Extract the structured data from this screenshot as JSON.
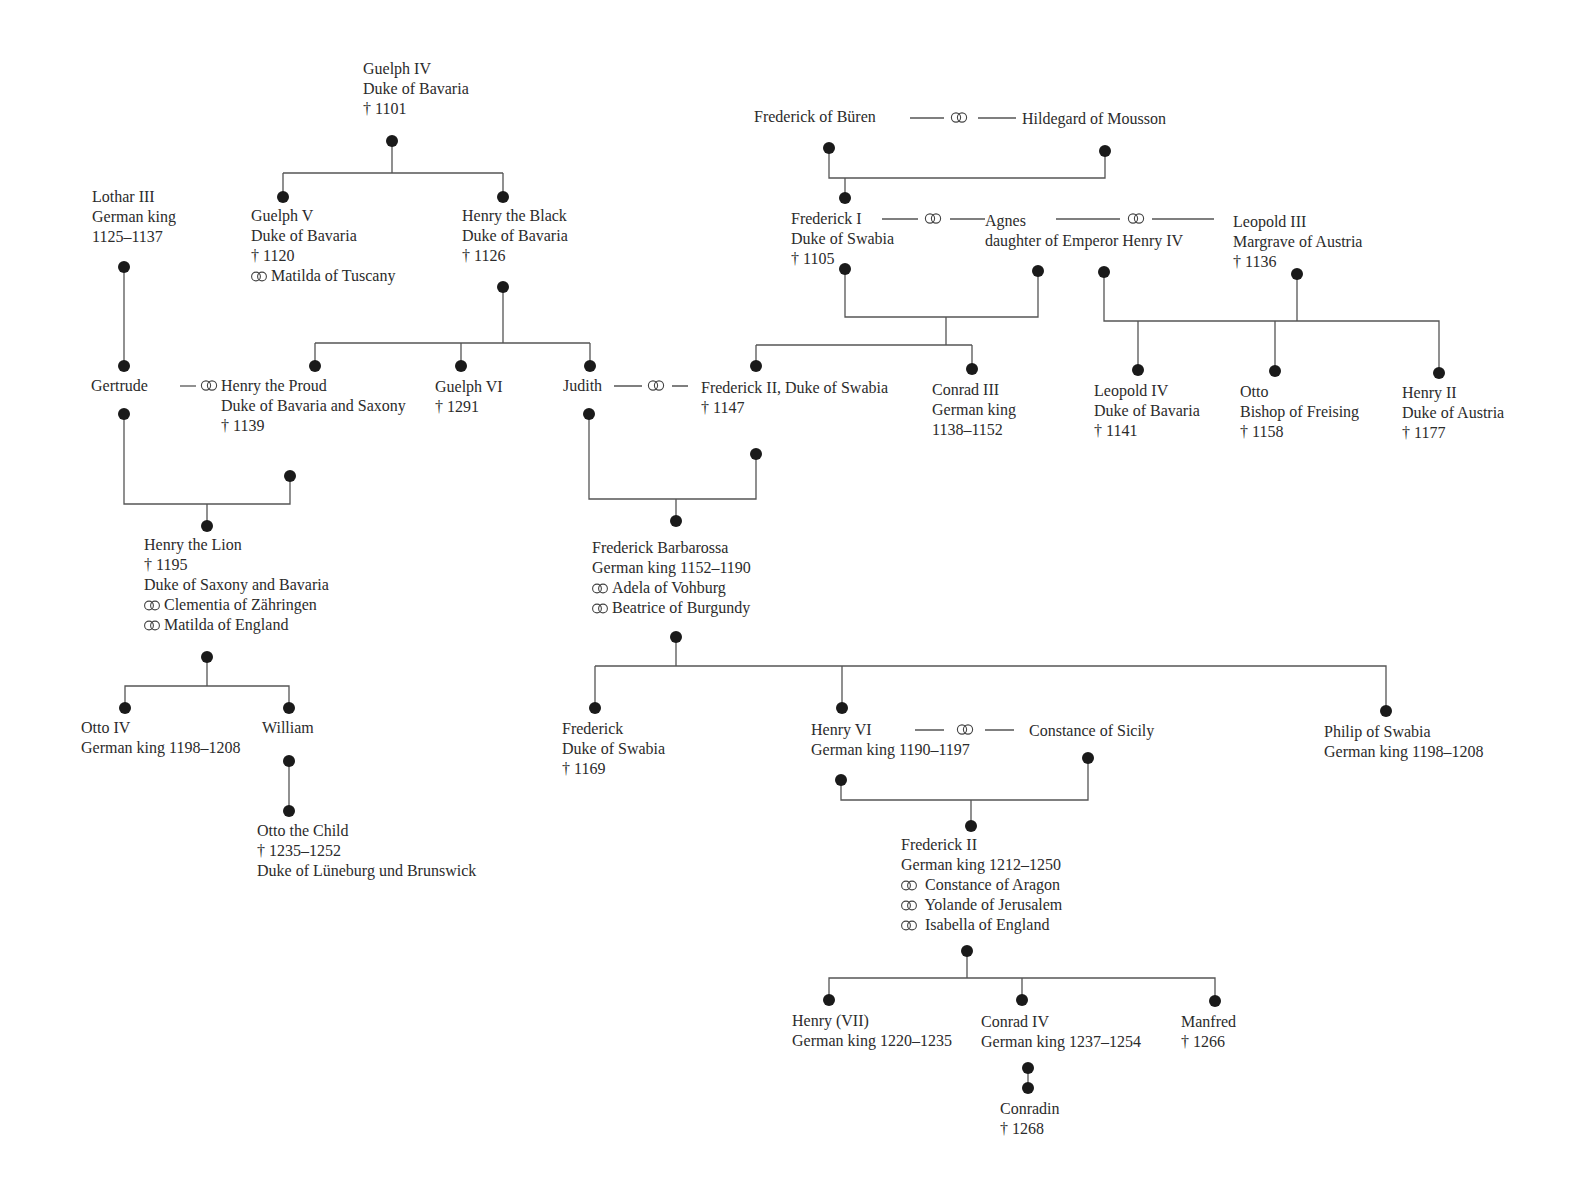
{
  "symbols": {
    "marriage": "marriage-rings",
    "died": "†"
  },
  "people": {
    "guelph_iv": [
      "Guelph IV",
      "Duke of Bavaria",
      "† 1101"
    ],
    "lothar_iii": [
      "Lothar III",
      "German king",
      "1125–1137"
    ],
    "guelph_v": [
      "Guelph V",
      "Duke of Bavaria",
      "† 1120",
      "Matilda of Tuscany"
    ],
    "henry_black": [
      "Henry the Black",
      "Duke of Bavaria",
      "† 1126"
    ],
    "frederick_buren": "Frederick of Büren",
    "hildegard": "Hildegard of Mousson",
    "frederick_i": [
      "Frederick I",
      "Duke of Swabia",
      "† 1105"
    ],
    "agnes": [
      "Agnes",
      "daughter of Emperor Henry IV"
    ],
    "leopold_iii": [
      "Leopold III",
      "Margrave of Austria",
      "† 1136"
    ],
    "gertrude": "Gertrude",
    "henry_proud": [
      "Henry the Proud",
      "Duke of Bavaria and Saxony",
      "† 1139"
    ],
    "guelph_vi": [
      "Guelph VI",
      "† 1291"
    ],
    "judith": "Judith",
    "frederick_ii_swabia": [
      "Frederick II, Duke of Swabia",
      "† 1147"
    ],
    "conrad_iii": [
      "Conrad III",
      "German king",
      "1138–1152"
    ],
    "leopold_iv": [
      "Leopold IV",
      "Duke of Bavaria",
      "† 1141"
    ],
    "otto_freising": [
      "Otto",
      "Bishop of Freising",
      "† 1158"
    ],
    "henry_ii_austria": [
      "Henry II",
      "Duke of Austria",
      "† 1177"
    ],
    "henry_lion": [
      "Henry the Lion",
      "† 1195",
      "Duke of Saxony and Bavaria",
      "Clementia of Zähringen",
      "Matilda of England"
    ],
    "barbarossa": [
      "Frederick Barbarossa",
      "German king 1152–1190",
      "Adela of Vohburg",
      "Beatrice of Burgundy"
    ],
    "otto_iv": [
      "Otto IV",
      "German king 1198–1208"
    ],
    "william": "William",
    "otto_child": [
      "Otto the Child",
      "† 1235–1252",
      "Duke of Lüneburg und Brunswick"
    ],
    "frederick_swabia_1169": [
      "Frederick",
      "Duke of Swabia",
      "† 1169"
    ],
    "henry_vi": [
      "Henry VI",
      "German king 1190–1197"
    ],
    "constance_sicily": "Constance of Sicily",
    "philip_swabia": [
      "Philip of Swabia",
      "German king 1198–1208"
    ],
    "frederick_ii": [
      "Frederick II",
      "German king 1212–1250",
      "Constance of Aragon",
      "Yolande of Jerusalem",
      "Isabella of England"
    ],
    "henry_vii": [
      "Henry (VII)",
      "German king 1220–1235"
    ],
    "conrad_iv": [
      "Conrad IV",
      "German king 1237–1254"
    ],
    "manfred": [
      "Manfred",
      "† 1266"
    ],
    "conradin": [
      "Conradin",
      "† 1268"
    ]
  }
}
